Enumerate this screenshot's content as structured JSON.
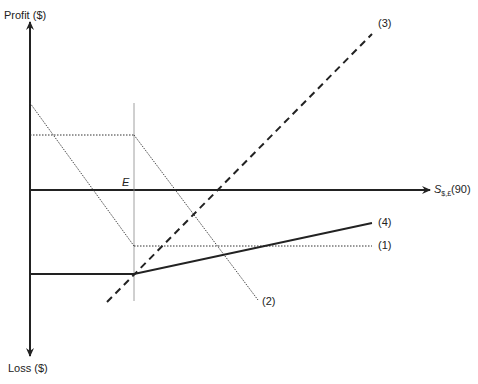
{
  "diagram": {
    "type": "payoff-diagram",
    "y_axis": {
      "top_label": "Profit ($)",
      "bottom_label": "Loss ($)"
    },
    "x_axis": {
      "label_main": "S",
      "label_sub": "$,£",
      "label_suffix": "(90)"
    },
    "strike_label": "E",
    "lines": [
      {
        "id": "1",
        "label": "(1)",
        "style": "dotted"
      },
      {
        "id": "2",
        "label": "(2)",
        "style": "dotted"
      },
      {
        "id": "3",
        "label": "(3)",
        "style": "dashed"
      },
      {
        "id": "4",
        "label": "(4)",
        "style": "solid"
      }
    ]
  },
  "colors": {
    "ink": "#222222",
    "background": "#ffffff"
  }
}
